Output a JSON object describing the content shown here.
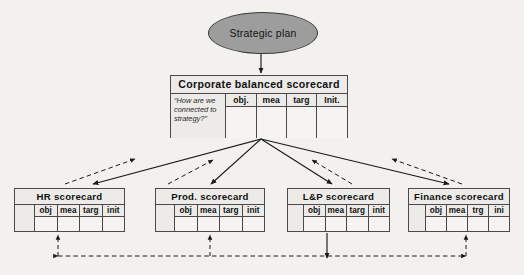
{
  "diagram": {
    "root": {
      "shape": "ellipse",
      "label": "Strategic plan",
      "fill": "#9d9d9d",
      "stroke": "#3a3a3a"
    },
    "corporate": {
      "title": "Corporate  balanced  scorecard",
      "question": "“How are we connected to strategy?”",
      "columns": [
        "obj.",
        "mea",
        "targ",
        "Init."
      ]
    },
    "units": [
      {
        "id": "hr",
        "title": "HR  scorecard",
        "columns": [
          "obj",
          "mea",
          "targ",
          "init"
        ]
      },
      {
        "id": "prod",
        "title": "Prod.  scorecard",
        "columns": [
          "obj",
          "mea",
          "targ",
          "init"
        ]
      },
      {
        "id": "lp",
        "title": "L&P  scorecard",
        "columns": [
          "obj",
          "mea",
          "targ",
          "init"
        ]
      },
      {
        "id": "finance",
        "title": "Finance  scorecard",
        "columns": [
          "obj",
          "mea",
          "trg",
          "ini"
        ]
      }
    ],
    "connectors": {
      "plan_to_corporate": "solid-down-arrow",
      "corporate_to_units": "solid-fan-arrows",
      "units_to_corporate": "dashed-feedback-arrows",
      "unit_alignment_bus": "dashed-horizontal-double-arrow"
    },
    "colors": {
      "background": "#f2f1ee",
      "box_fill": "#ecebe8",
      "cell_fill": "#f5f4f2",
      "line": "#1a1a1a",
      "text": "#111111"
    }
  }
}
